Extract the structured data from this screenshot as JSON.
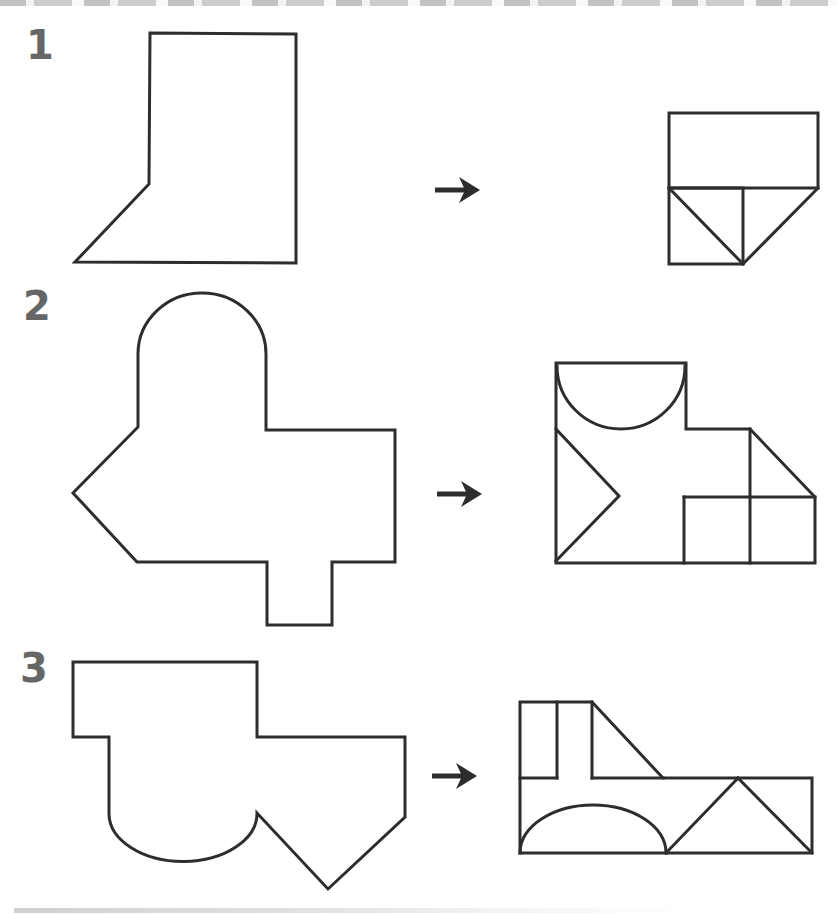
{
  "page": {
    "kind": "shape-fold-puzzle-worksheet",
    "background": "#ffffff",
    "ink": "#2d2d2d",
    "label_color": "#666666"
  },
  "rows": [
    {
      "number": "1",
      "arrow": {
        "glyph": "right-arrow",
        "cx": 458,
        "cy": 190
      },
      "source": {
        "name": "rectangle-with-cut-corner",
        "paths": [
          "M150 33 L296 34 L296 263 L75 262 L149 184 Z"
        ]
      },
      "target": {
        "name": "folded-rectangle-with-triangles",
        "paths": [
          "M669 113 L818 113 L818 188 L669 188 Z",
          "M669 188 L743 188 L743 264 L669 264 Z",
          "M669 188 L743 264",
          "M818 188 L743 264"
        ]
      }
    },
    {
      "number": "2",
      "arrow": {
        "glyph": "right-arrow",
        "cx": 460,
        "cy": 494
      },
      "source": {
        "name": "dome-arrow-outline-with-tab",
        "paths": [
          "M138 354 A64 61 0 0 1 266 354 L266 430 L395 430 L395 562 L332 562 L332 625 L267 625 L267 562 L137 562 L73 493 L138 427 Z"
        ]
      },
      "target": {
        "name": "folded-square-with-semicircle-triangle-squares",
        "paths": [
          "M556 363 L686 363 L686 429 L750 429 L815 497 L815 563 L556 563 Z",
          "M557 366 A64 63 0 0 0 685 366",
          "M556 429 L619 496 L556 561",
          "M750 429 L750 563",
          "M684 497 L815 497",
          "M684 497 L684 563"
        ]
      }
    },
    {
      "number": "3",
      "arrow": {
        "glyph": "right-arrow",
        "cx": 455,
        "cy": 776
      },
      "source": {
        "name": "stepped-outline-with-scallop-and-notch",
        "paths": [
          "M73 662 L257 662 L257 737 L405 737 L405 817 L328 889 L257 813 A74 48 0 0 1 109 814 L109 737 L73 737 Z"
        ]
      },
      "target": {
        "name": "folded-strip-with-arch-and-tent-triangles",
        "paths": [
          "M520 702 L592 702 L663 778 L812 778 L812 853 L520 853 Z",
          "M557 702 L557 778",
          "M520 778 L557 778",
          "M592 702 L592 778",
          "M592 778 L663 778",
          "M520 853 A73 48 0 0 1 666 853",
          "M666 853 L738 778",
          "M738 778 L812 853"
        ]
      }
    }
  ]
}
